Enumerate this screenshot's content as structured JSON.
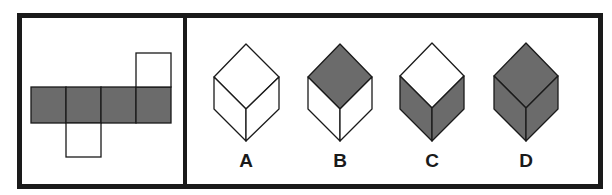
{
  "puzzle": {
    "type": "cube-net-folding",
    "colors": {
      "shaded": "#6b6b6b",
      "unshaded": "#ffffff",
      "line": "#1a1a1a",
      "border": "#1a1a1a"
    },
    "net": {
      "squares": [
        {
          "id": "row-1",
          "shade": "shaded"
        },
        {
          "id": "row-2",
          "shade": "shaded"
        },
        {
          "id": "row-3",
          "shade": "shaded"
        },
        {
          "id": "row-4",
          "shade": "shaded"
        },
        {
          "id": "top-of-4",
          "shade": "unshaded"
        },
        {
          "id": "bottom-of-2",
          "shade": "unshaded"
        }
      ]
    },
    "options": [
      {
        "label": "A",
        "top": "unshaded",
        "left": "unshaded",
        "right": "unshaded"
      },
      {
        "label": "B",
        "top": "shaded",
        "left": "unshaded",
        "right": "unshaded"
      },
      {
        "label": "C",
        "top": "unshaded",
        "left": "shaded",
        "right": "shaded"
      },
      {
        "label": "D",
        "top": "shaded",
        "left": "shaded",
        "right": "shaded"
      }
    ]
  }
}
